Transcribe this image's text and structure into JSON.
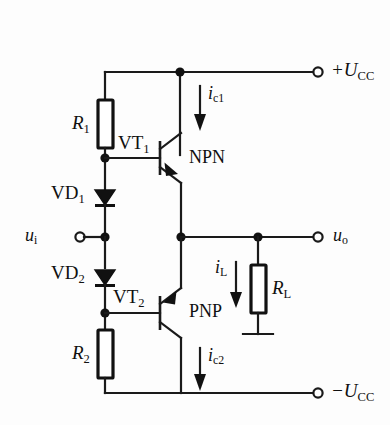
{
  "figure": {
    "kind": "circuit-schematic",
    "background_color": "#fdfdfd",
    "line_color": "#1a1a1a",
    "width": 390,
    "height": 425
  },
  "terminals": [
    {
      "name": "supply-positive",
      "label_main": "+U",
      "label_sub": "CC",
      "x": 318,
      "y": 72
    },
    {
      "name": "input",
      "label_main": "u",
      "label_sub": "i",
      "x": 70,
      "y": 237
    },
    {
      "name": "output",
      "label_main": "u",
      "label_sub": "o",
      "x": 318,
      "y": 237
    },
    {
      "name": "supply-negative",
      "label_main": "−U",
      "label_sub": "CC",
      "x": 318,
      "y": 393
    }
  ],
  "components": [
    {
      "name": "resistor-r1",
      "label_main": "R",
      "label_sub": "1",
      "type": "resistor"
    },
    {
      "name": "resistor-r2",
      "label_main": "R",
      "label_sub": "2",
      "type": "resistor"
    },
    {
      "name": "resistor-rl",
      "label_main": "R",
      "label_sub": "L",
      "type": "resistor"
    },
    {
      "name": "diode-vd1",
      "label_main": "VD",
      "label_sub": "1",
      "type": "diode"
    },
    {
      "name": "diode-vd2",
      "label_main": "VD",
      "label_sub": "2",
      "type": "diode"
    },
    {
      "name": "transistor-vt1",
      "label_main": "VT",
      "label_sub": "1",
      "type": "bjt",
      "polarity": "NPN"
    },
    {
      "name": "transistor-vt2",
      "label_main": "VT",
      "label_sub": "2",
      "type": "bjt",
      "polarity": "PNP"
    }
  ],
  "annotations": {
    "npn_text": "NPN",
    "pnp_text": "PNP",
    "current_ic1_main": "i",
    "current_ic1_sub": "c1",
    "current_ic2_main": "i",
    "current_ic2_sub": "c2",
    "current_il_main": "i",
    "current_il_sub": "L"
  },
  "labels": {
    "r1": {
      "main": "R",
      "sub": "1"
    },
    "r2": {
      "main": "R",
      "sub": "2"
    },
    "rl": {
      "main": "R",
      "sub": "L"
    },
    "vd1": {
      "main": "VD",
      "sub": "1"
    },
    "vd2": {
      "main": "VD",
      "sub": "2"
    },
    "vt1": {
      "main": "VT",
      "sub": "1"
    },
    "vt2": {
      "main": "VT",
      "sub": "2"
    },
    "ui": {
      "main": "u",
      "sub": "i"
    },
    "uo": {
      "main": "u",
      "sub": "o"
    },
    "ucc_pos": {
      "main": "+U",
      "sub": "CC"
    },
    "ucc_neg": {
      "main": "−U",
      "sub": "CC"
    },
    "ic1": {
      "main": "i",
      "sub": "c1"
    },
    "ic2": {
      "main": "i",
      "sub": "c2"
    },
    "il": {
      "main": "i",
      "sub": "L"
    },
    "npn": {
      "main": "NPN",
      "sub": ""
    },
    "pnp": {
      "main": "PNP",
      "sub": ""
    }
  }
}
